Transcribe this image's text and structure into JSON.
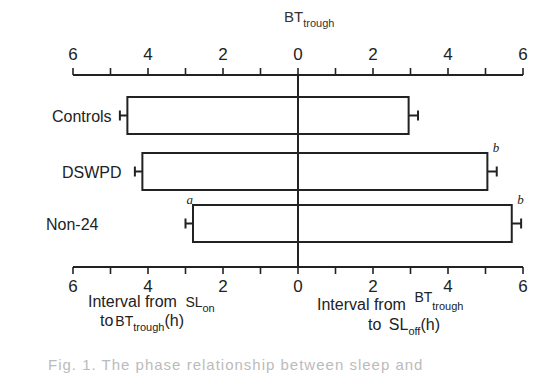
{
  "chart_data": {
    "type": "bar",
    "orientation": "horizontal-diverging",
    "title": "BT",
    "title_subscript": "trough",
    "categories": [
      "Controls",
      "DSWPD",
      "Non-24"
    ],
    "series": [
      {
        "name": "Interval from SLon to BTtrough (h)",
        "direction": "left",
        "values": [
          4.55,
          4.15,
          2.8
        ],
        "errors": [
          0.2,
          0.2,
          0.2
        ],
        "annotations": [
          "",
          "",
          "a"
        ]
      },
      {
        "name": "Interval from BTtrough to SLoff (h)",
        "direction": "right",
        "values": [
          2.95,
          5.05,
          5.7
        ],
        "errors": [
          0.25,
          0.25,
          0.25
        ],
        "annotations": [
          "",
          "b",
          "b"
        ]
      }
    ],
    "x_ticks_left": [
      "6",
      "4",
      "2",
      "0"
    ],
    "x_ticks_right": [
      "2",
      "4",
      "6"
    ],
    "xlim": [
      -6,
      6
    ],
    "minor_tick_step": 1,
    "major_tick_step": 2,
    "xlabel_left": {
      "line1": "Interval from",
      "line1_sym": "SL",
      "line1_sub": "on",
      "line2": "to",
      "line2_sym": "BT",
      "line2_sub": "trough",
      "line2_unit": "(h)"
    },
    "xlabel_right": {
      "line1": "Interval from",
      "line1_sym": "BT",
      "line1_sub": "trough",
      "line2": "to",
      "line2_sym": "SL",
      "line2_sub": "off",
      "line2_unit": "(h)"
    },
    "grid": false,
    "legend": "none"
  },
  "caption": "Fig. 1. The phase relationship between sleep and"
}
